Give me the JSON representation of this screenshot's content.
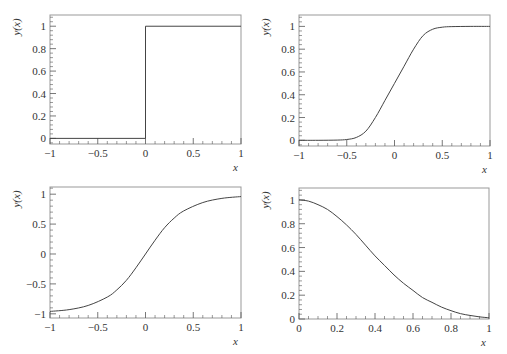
{
  "figure": {
    "panels": 4,
    "layout": "2x2"
  },
  "chart_data": [
    {
      "id": "top-left",
      "type": "line",
      "title": "",
      "xlabel": "x",
      "ylabel": "y(x)",
      "xlim": [
        -1,
        1
      ],
      "ylim": [
        -0.05,
        1.1
      ],
      "xticks": [
        -1,
        -0.5,
        0,
        0.5,
        1
      ],
      "xtick_labels": [
        "−1",
        "−0.5",
        "0",
        "0.5",
        "1"
      ],
      "yticks": [
        0,
        0.2,
        0.4,
        0.6,
        0.8,
        1
      ],
      "ytick_labels": [
        "0",
        "0.2",
        "0.4",
        "0.6",
        "0.8",
        "1"
      ],
      "grid": false,
      "description": "Step function",
      "x": [
        -1,
        0,
        0,
        1
      ],
      "y": [
        0,
        0,
        1,
        1
      ],
      "frame": {
        "left": 50,
        "top": 15,
        "right": 241,
        "bottom": 144
      }
    },
    {
      "id": "top-right",
      "type": "line",
      "title": "",
      "xlabel": "x",
      "ylabel": "y(x)",
      "xlim": [
        -1,
        1
      ],
      "ylim": [
        -0.05,
        1.1
      ],
      "xticks": [
        -1,
        -0.5,
        0,
        0.5,
        1
      ],
      "xtick_labels": [
        "−1",
        "−0.5",
        "0",
        "0.5",
        "1"
      ],
      "yticks": [
        0,
        0.2,
        0.4,
        0.6,
        0.8,
        1
      ],
      "ytick_labels": [
        "0",
        "0.2",
        "0.4",
        "0.6",
        "0.8",
        "1"
      ],
      "grid": false,
      "description": "Smooth sigmoid from 0 to 1 centred at x=0",
      "x": [
        -1,
        -0.8,
        -0.6,
        -0.5,
        -0.4,
        -0.3,
        -0.2,
        -0.1,
        0,
        0.1,
        0.2,
        0.3,
        0.4,
        0.5,
        0.6,
        0.8,
        1
      ],
      "y": [
        0,
        0,
        0.002,
        0.007,
        0.025,
        0.08,
        0.2,
        0.35,
        0.5,
        0.65,
        0.8,
        0.92,
        0.975,
        0.993,
        0.998,
        1,
        1
      ],
      "frame": {
        "left": 299,
        "top": 15,
        "right": 490,
        "bottom": 146
      }
    },
    {
      "id": "bottom-left",
      "type": "line",
      "title": "",
      "xlabel": "x",
      "ylabel": "y(x)",
      "xlim": [
        -1,
        1
      ],
      "ylim": [
        -1.07,
        1.12
      ],
      "xticks": [
        -1,
        -0.5,
        0,
        0.5,
        1
      ],
      "xtick_labels": [
        "−1",
        "−0.5",
        "0",
        "0.5",
        "1"
      ],
      "yticks": [
        -1,
        -0.5,
        0,
        0.5,
        1
      ],
      "ytick_labels": [
        "−1",
        "−0.5",
        "0",
        "0.5",
        "1"
      ],
      "grid": false,
      "description": "Smooth odd sigmoid from -1 to 1 (tanh-like)",
      "x": [
        -1,
        -0.8,
        -0.6,
        -0.4,
        -0.3,
        -0.2,
        -0.1,
        0,
        0.1,
        0.2,
        0.3,
        0.4,
        0.6,
        0.8,
        1
      ],
      "y": [
        -0.96,
        -0.93,
        -0.86,
        -0.72,
        -0.6,
        -0.44,
        -0.23,
        0,
        0.23,
        0.44,
        0.6,
        0.72,
        0.86,
        0.93,
        0.96
      ],
      "frame": {
        "left": 50,
        "top": 187,
        "right": 241,
        "bottom": 318
      }
    },
    {
      "id": "bottom-right",
      "type": "line",
      "title": "",
      "xlabel": "x",
      "ylabel": "y(x)",
      "xlim": [
        0,
        1
      ],
      "ylim": [
        0,
        1.1
      ],
      "xticks": [
        0,
        0.2,
        0.4,
        0.6,
        0.8,
        1
      ],
      "xtick_labels": [
        "0",
        "0.2",
        "0.4",
        "0.6",
        "0.8",
        "1"
      ],
      "yticks": [
        0,
        0.2,
        0.4,
        0.6,
        0.8,
        1
      ],
      "ytick_labels": [
        "0",
        "0.2",
        "0.4",
        "0.6",
        "0.8",
        "1"
      ],
      "grid": false,
      "description": "Smooth decreasing curve from 1 at x=0 to ~0 at x=1",
      "x": [
        0,
        0.05,
        0.1,
        0.15,
        0.2,
        0.25,
        0.3,
        0.35,
        0.4,
        0.45,
        0.5,
        0.55,
        0.6,
        0.65,
        0.7,
        0.75,
        0.8,
        0.85,
        0.9,
        0.95,
        1
      ],
      "y": [
        1,
        0.99,
        0.96,
        0.92,
        0.86,
        0.79,
        0.71,
        0.62,
        0.53,
        0.45,
        0.37,
        0.3,
        0.24,
        0.18,
        0.14,
        0.1,
        0.07,
        0.045,
        0.03,
        0.018,
        0.01
      ],
      "frame": {
        "left": 299,
        "top": 188,
        "right": 489,
        "bottom": 319
      }
    }
  ]
}
